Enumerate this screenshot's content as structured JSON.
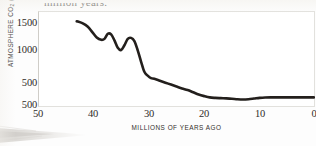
{
  "figure": {
    "top_caption": "million years.",
    "x_axis_title": "MILLIONS OF YEARS AGO",
    "y_axis_title_prefix": "ATMOSPHERE CO",
    "y_axis_title_sub": "2",
    "y_axis_title_suffix": " (PPM)"
  },
  "colors": {
    "curve": "#231f1c",
    "frame": "#e2e1dd",
    "text": "#2e2b28",
    "page": "#fdfdfd",
    "smudge": "#b9b4ab"
  },
  "chart_data": {
    "type": "line",
    "xlabel": "MILLIONS OF YEARS AGO",
    "ylabel": "ATMOSPHERE CO2 (PPM)",
    "xlim": [
      50,
      0
    ],
    "ylim": [
      150,
      1650
    ],
    "x_reversed": true,
    "grid": false,
    "legend": null,
    "xticks": [
      50,
      40,
      30,
      20,
      10,
      0
    ],
    "xtick_labels": [
      "50",
      "40",
      "30",
      "20",
      "10",
      "0"
    ],
    "yticks": [
      1500,
      1000,
      500,
      200
    ],
    "ytick_labels": [
      "1500",
      "1000",
      "500",
      "500"
    ],
    "ytick_note": "bottom tick is printed 500 in the scanned original (duplicate label artifact)",
    "series": [
      {
        "name": "Atmospheric CO2",
        "x": [
          43.0,
          42.0,
          41.0,
          40.2,
          39.4,
          38.6,
          38.0,
          37.4,
          36.8,
          36.2,
          35.6,
          35.0,
          34.4,
          33.8,
          33.2,
          32.6,
          32.0,
          31.4,
          30.8,
          30.2,
          29.6,
          29.0,
          28.0,
          27.0,
          26.0,
          25.0,
          24.0,
          23.0,
          22.0,
          21.0,
          20.0,
          19.0,
          18.0,
          17.0,
          16.0,
          15.0,
          14.0,
          13.0,
          12.0,
          11.0,
          10.0,
          9.0,
          8.0,
          7.0,
          6.0,
          5.0,
          4.0,
          3.0,
          2.0,
          1.0,
          0.2
        ],
        "y": [
          1490,
          1460,
          1405,
          1320,
          1235,
          1200,
          1215,
          1295,
          1285,
          1190,
          1075,
          1040,
          1115,
          1215,
          1230,
          1180,
          1035,
          860,
          700,
          640,
          600,
          590,
          560,
          530,
          500,
          470,
          440,
          415,
          380,
          345,
          320,
          300,
          292,
          288,
          285,
          280,
          272,
          268,
          272,
          282,
          292,
          298,
          300,
          300,
          300,
          300,
          300,
          300,
          300,
          300,
          300
        ]
      }
    ]
  }
}
